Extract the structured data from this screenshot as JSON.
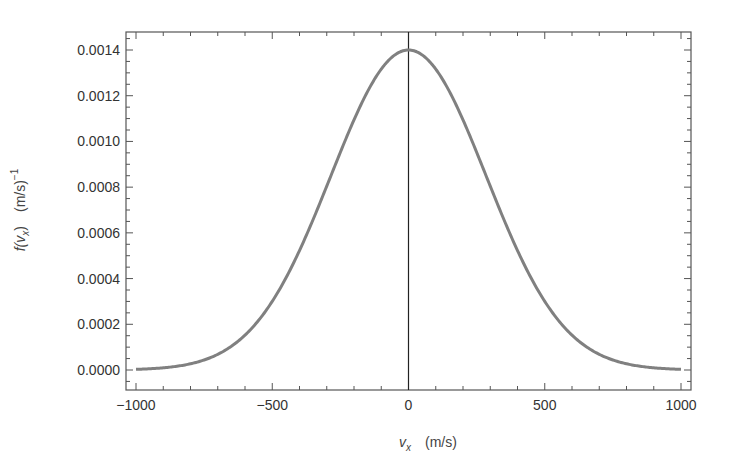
{
  "chart_data": {
    "type": "line",
    "title": "",
    "xlabel": "v_x   (m/s)",
    "ylabel": "f(v_x)   (m/s)^-1",
    "xlabel_parts": {
      "var": "v",
      "sub": "x",
      "unit": "(m/s)"
    },
    "ylabel_parts": {
      "func": "f(v",
      "sub": "x",
      "close": ")",
      "unit": "(m/s)",
      "sup": "−1"
    },
    "xlim": [
      -1000,
      1000
    ],
    "ylim": [
      -8e-05,
      0.00148
    ],
    "x_ticks": [
      -1000,
      -500,
      0,
      500,
      1000
    ],
    "x_tick_labels": [
      "−1000",
      "−500",
      "0",
      "500",
      "1000"
    ],
    "y_ticks": [
      0.0,
      0.0002,
      0.0004,
      0.0006,
      0.0008,
      0.001,
      0.0012,
      0.0014
    ],
    "y_tick_labels": [
      "0.0000",
      "0.0002",
      "0.0004",
      "0.0006",
      "0.0008",
      "0.0010",
      "0.0012",
      "0.0014"
    ],
    "grid": false,
    "frame": true,
    "vertical_line_at_x": 0,
    "series": [
      {
        "name": "f(v_x)",
        "description": "Gaussian (Maxwell 1D velocity distribution), mean 0, sigma ≈ 285 m/s",
        "color": "#808080",
        "x": [
          -1000,
          -900,
          -800,
          -700,
          -600,
          -500,
          -400,
          -300,
          -200,
          -100,
          0,
          100,
          200,
          300,
          400,
          500,
          600,
          700,
          800,
          900,
          1000
        ],
        "values": [
          2.9e-06,
          9.5e-06,
          2.72e-05,
          6.86e-05,
          0.0001521,
          0.0002996,
          0.0005228,
          0.0008077,
          0.0011066,
          0.001315,
          0.0014,
          0.001315,
          0.0011066,
          0.0008077,
          0.0005228,
          0.0002996,
          0.0001521,
          6.86e-05,
          2.72e-05,
          9.5e-06,
          2.9e-06
        ]
      }
    ]
  },
  "colors": {
    "curve": "#808080",
    "frame": "#555555",
    "axis_line": "#222222",
    "text": "#333333"
  }
}
